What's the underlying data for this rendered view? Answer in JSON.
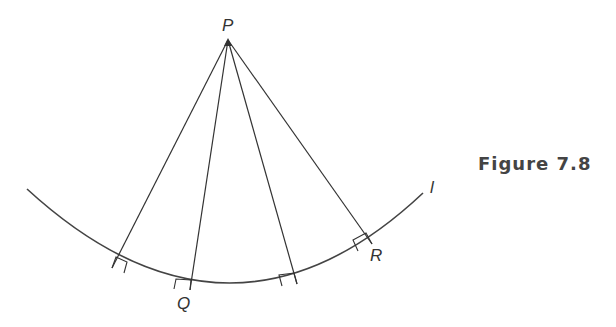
{
  "caption": "Figure 7.8",
  "labels": {
    "P": "P",
    "Q": "Q",
    "R": "R",
    "l": "l"
  },
  "geometry": {
    "apex": [
      228,
      40
    ],
    "arc": {
      "start": [
        27,
        189
      ],
      "bottom": [
        240,
        292
      ],
      "end": [
        423,
        193
      ]
    },
    "feet": [
      [
        112,
        268
      ],
      [
        190,
        290
      ],
      [
        297,
        284
      ],
      [
        372,
        244
      ]
    ],
    "line_color": "#333333"
  }
}
